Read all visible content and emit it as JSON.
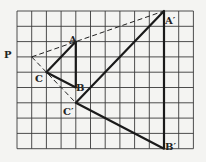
{
  "diagram": {
    "type": "geometry-dilation-grid",
    "grid": {
      "cols": 12,
      "rows": 9,
      "line_color": "#333333",
      "background": "#f4f4f2"
    },
    "points": {
      "P": {
        "label": "P",
        "col": 1,
        "row": 3
      },
      "A": {
        "label": "A",
        "col": 4,
        "row": 2
      },
      "B": {
        "label": "B",
        "col": 4,
        "row": 5
      },
      "C": {
        "label": "C",
        "col": 2,
        "row": 4
      },
      "A_prime": {
        "label": "A′",
        "col": 10,
        "row": 0
      },
      "B_prime": {
        "label": "B′",
        "col": 10,
        "row": 9
      },
      "C_prime": {
        "label": "C′",
        "col": 4,
        "row": 6
      }
    },
    "triangles": [
      {
        "name": "ABC",
        "vertices": [
          "A",
          "B",
          "C"
        ]
      },
      {
        "name": "A′B′C′",
        "vertices": [
          "A′",
          "B′",
          "C′"
        ]
      }
    ],
    "dashed_rays": [
      {
        "from": "P",
        "to": "A′"
      },
      {
        "from": "P",
        "to": "C′"
      }
    ]
  }
}
